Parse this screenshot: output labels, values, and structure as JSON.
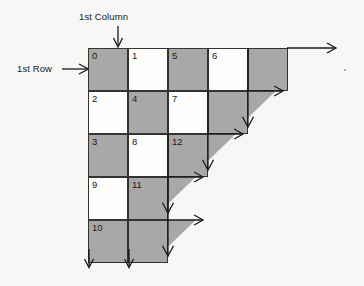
{
  "diagram": {
    "background_color": "#f8f7f5",
    "cell_gray_color": "#a8a8a8",
    "cell_white_color": "#fdfdfc",
    "border_color": "#333333",
    "annotations": {
      "column_label": "1st Column",
      "row_label": "1st Row"
    },
    "geometry": {
      "origin_x": 88,
      "origin_y": 48,
      "cell_width": 40,
      "cell_height": 43
    },
    "rows": [
      {
        "index": 0,
        "cells": [
          {
            "label": "0",
            "fill": "gray"
          },
          {
            "label": "1",
            "fill": "white"
          },
          {
            "label": "5",
            "fill": "gray"
          },
          {
            "label": "6",
            "fill": "white"
          },
          {
            "label": "",
            "fill": "gray"
          }
        ],
        "end_arrow": "right"
      },
      {
        "index": 1,
        "cells": [
          {
            "label": "2",
            "fill": "white"
          },
          {
            "label": "4",
            "fill": "gray"
          },
          {
            "label": "7",
            "fill": "white"
          },
          {
            "label": "",
            "fill": "gray"
          }
        ],
        "end_arrow": "corner"
      },
      {
        "index": 2,
        "cells": [
          {
            "label": "3",
            "fill": "gray"
          },
          {
            "label": "8",
            "fill": "white"
          },
          {
            "label": "12",
            "fill": "gray"
          }
        ],
        "end_arrow": "corner"
      },
      {
        "index": 3,
        "cells": [
          {
            "label": "9",
            "fill": "white"
          },
          {
            "label": "11",
            "fill": "gray"
          }
        ],
        "end_arrow": "corner"
      },
      {
        "index": 4,
        "cells": [
          {
            "label": "10",
            "fill": "gray"
          },
          {
            "label": "",
            "fill": "gray"
          }
        ],
        "end_arrow": "corner"
      }
    ]
  }
}
